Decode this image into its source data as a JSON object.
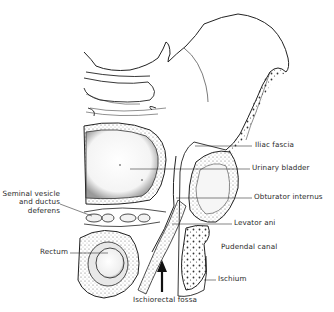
{
  "figure": {
    "colors": {
      "line": "#222222",
      "stipple": "#555555",
      "background": "#ffffff",
      "label": "#2a2a2a"
    }
  },
  "labels": {
    "iliac_fascia": "Iliac fascia",
    "urinary_bladder": "Urinary bladder",
    "seminal_vesicle_line1": "Seminal vesicle",
    "seminal_vesicle_line2": "and ductus",
    "seminal_vesicle_line3": "deferens",
    "obturator_internus": "Obturator internus",
    "levator_ani": "Levator ani",
    "pudendal_canal": "Pudendal canal",
    "rectum": "Rectum",
    "ischium": "Ischium",
    "ischiorectal_fossa": "Ischiorectal fossa"
  }
}
